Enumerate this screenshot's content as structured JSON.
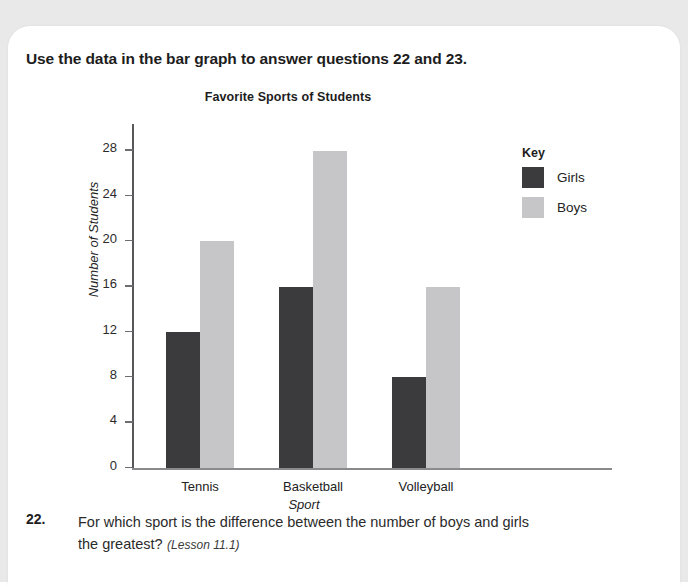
{
  "instruction": "Use the data in the bar graph to answer questions 22 and 23.",
  "chart_data": {
    "type": "bar",
    "title": "Favorite Sports of Students",
    "xlabel": "Sport",
    "ylabel": "Number of Students",
    "categories": [
      "Tennis",
      "Basketball",
      "Volleyball"
    ],
    "series": [
      {
        "name": "Girls",
        "color": "#3b3b3d",
        "values": [
          12,
          16,
          8
        ]
      },
      {
        "name": "Boys",
        "color": "#c6c6c8",
        "values": [
          20,
          28,
          16
        ]
      }
    ],
    "ylim": [
      0,
      30
    ],
    "yticks": [
      0,
      4,
      8,
      12,
      16,
      20,
      24,
      28
    ],
    "grid": false,
    "legend_title": "Key",
    "legend_position": "right"
  },
  "question": {
    "number": "22.",
    "text": "For which sport is the difference between the number of boys and girls the greatest?",
    "lesson": "(Lesson 11.1)"
  }
}
